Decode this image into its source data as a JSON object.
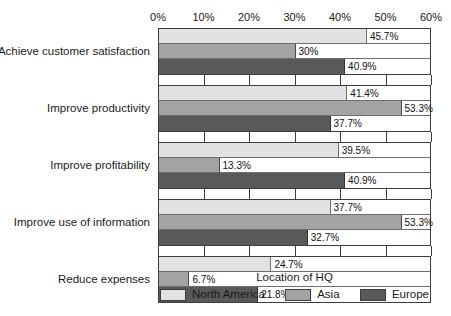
{
  "chart_data": {
    "type": "bar",
    "orientation": "horizontal",
    "title": "",
    "xlabel": "",
    "ylabel": "",
    "xlim": [
      0,
      60
    ],
    "xticks": [
      0,
      10,
      20,
      30,
      40,
      50,
      60
    ],
    "xtick_labels": [
      "0%",
      "10%",
      "20%",
      "30%",
      "40%",
      "50%",
      "60%"
    ],
    "grid": true,
    "legend_title": "Location of HQ",
    "legend_position": "bottom",
    "categories": [
      "Achieve customer satisfaction",
      "Improve productivity",
      "Improve profitability",
      "Improve use of information",
      "Reduce expenses"
    ],
    "series": [
      {
        "name": "North America",
        "color": "#e2e2e2",
        "values": [
          45.7,
          41.4,
          39.5,
          37.7,
          24.7
        ],
        "labels": [
          "45.7%",
          "41.4%",
          "39.5%",
          "37.7%",
          "24.7%"
        ]
      },
      {
        "name": "Asia",
        "color": "#a3a3a3",
        "values": [
          30,
          53.3,
          13.3,
          53.3,
          6.7
        ],
        "labels": [
          "30%",
          "53.3%",
          "13.3%",
          "53.3%",
          "6.7%"
        ]
      },
      {
        "name": "Europe",
        "color": "#595959",
        "values": [
          40.9,
          37.7,
          40.9,
          32.7,
          21.8
        ],
        "labels": [
          "40.9%",
          "37.7%",
          "40.9%",
          "32.7%",
          "21.8%"
        ]
      }
    ]
  }
}
